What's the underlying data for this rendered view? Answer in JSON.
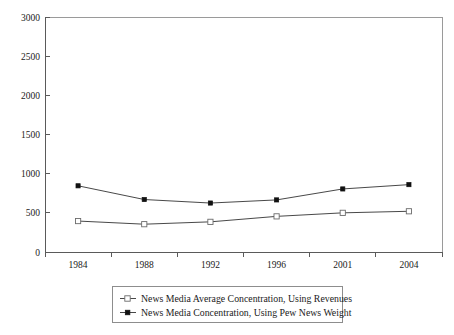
{
  "chart_data": {
    "type": "line",
    "title": "",
    "subtitle": "",
    "xlabel": "",
    "ylabel": "",
    "categories": [
      "1984",
      "1988",
      "1992",
      "1996",
      "2001",
      "2004"
    ],
    "ylim": [
      0,
      3000
    ],
    "yticks": [
      0,
      500,
      1000,
      1500,
      2000,
      2500,
      3000
    ],
    "ytick_labels": [
      "0",
      "500",
      "1000",
      "1500",
      "2000",
      "2500",
      "3000"
    ],
    "grid": false,
    "legend_position": "bottom",
    "series": [
      {
        "name": "News Media Average Concentration, Using Revenues",
        "marker": "open-square",
        "color": "#333333",
        "values": [
          395,
          355,
          385,
          455,
          500,
          520
        ]
      },
      {
        "name": "News Media Concentration, Using Pew News Weight",
        "marker": "filled-square",
        "color": "#111111",
        "values": [
          845,
          670,
          625,
          665,
          805,
          860
        ]
      }
    ]
  },
  "legend": {
    "entries": [
      {
        "label": "News Media Average Concentration, Using Revenues",
        "marker": "open-square"
      },
      {
        "label": "News Media Concentration, Using Pew News Weight",
        "marker": "filled-square"
      }
    ]
  },
  "axes": {
    "y_tick_labels": [
      "3000",
      "2500",
      "2000",
      "1500",
      "1000",
      "500",
      "0"
    ],
    "x_tick_labels": [
      "1984",
      "1988",
      "1992",
      "1996",
      "2001",
      "2004"
    ]
  }
}
